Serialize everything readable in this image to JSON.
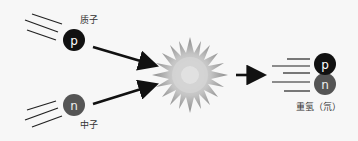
{
  "diagram": {
    "proton": {
      "symbol": "p",
      "label": "质子",
      "color": "#111111"
    },
    "neutron": {
      "symbol": "n",
      "label": "中子",
      "color": "#555555"
    },
    "product": {
      "label": "重氢（氘）",
      "top_symbol": "p",
      "bottom_symbol": "n"
    },
    "collision": {
      "icon": "starburst-icon",
      "color": "#b8b8b8"
    },
    "arrow_color": "#111111"
  }
}
